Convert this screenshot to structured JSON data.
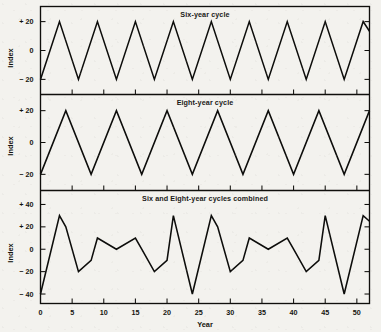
{
  "figure": {
    "xlabel": "Year",
    "ylabel": "Index",
    "background_color": "#f3f2ee",
    "line_color": "#0d0d0b"
  },
  "chart_data": {
    "type": "line",
    "title": "Six and Eight-year cycles combined",
    "xlabel": "Year",
    "ylabel": "Index",
    "xlim": [
      0,
      52
    ],
    "xticks": [
      0,
      5,
      10,
      15,
      20,
      25,
      30,
      35,
      40,
      45,
      50
    ],
    "xtick_labels": [
      "0",
      "5",
      "10",
      "15",
      "20",
      "25",
      "30",
      "35",
      "40",
      "45",
      "50"
    ],
    "grid": false,
    "legend": "none",
    "panels": [
      {
        "title": "Six-year cycle",
        "ylabel": "Index",
        "ylim": [
          -27,
          27
        ],
        "yticks": [
          20,
          0,
          -20
        ],
        "ytick_labels": [
          "+ 20",
          "0",
          "− 20"
        ],
        "period": 6,
        "amplitude": 20,
        "trough_year": 0,
        "peak_year": 3,
        "description": "Triangle wave, minimum -20 at year 0, maximum +20 at year 3, repeating every 6 years",
        "x": [
          0,
          3,
          6,
          9,
          12,
          15,
          18,
          21,
          24,
          27,
          30,
          33,
          36,
          39,
          42,
          45,
          48,
          51,
          52
        ],
        "y": [
          -20,
          20,
          -20,
          20,
          -20,
          20,
          -20,
          20,
          -20,
          20,
          -20,
          20,
          -20,
          20,
          -20,
          20,
          -20,
          20,
          13.3
        ]
      },
      {
        "title": "Eight-year cycle",
        "ylabel": "Index",
        "ylim": [
          -27,
          27
        ],
        "yticks": [
          20,
          0,
          -20
        ],
        "ytick_labels": [
          "+ 20",
          "0",
          "− 20"
        ],
        "period": 8,
        "amplitude": 20,
        "trough_year": 0,
        "peak_year": 4,
        "description": "Triangle wave, minimum -20 at year 0, maximum +20 at year 4, repeating every 8 years",
        "x": [
          0,
          4,
          8,
          12,
          16,
          20,
          24,
          28,
          32,
          36,
          40,
          44,
          48,
          52
        ],
        "y": [
          -20,
          20,
          -20,
          20,
          -20,
          20,
          -20,
          20,
          -20,
          20,
          -20,
          20,
          -20,
          20
        ]
      },
      {
        "title": "Six and Eight-year cycles combined",
        "ylabel": "Index",
        "ylim": [
          -44,
          48
        ],
        "yticks": [
          40,
          20,
          0,
          -20,
          -40
        ],
        "ytick_labels": [
          "+ 40",
          "+ 20",
          "0",
          "− 20",
          "− 40"
        ],
        "period": 24,
        "description": "Point-by-point sum of the six-year and eight-year triangle waves; repeats every 24 years, deep minimum of -40 at years 0, 24 and 48",
        "x": [
          0,
          3,
          4,
          6,
          8,
          9,
          12,
          15,
          16,
          18,
          20,
          21,
          24,
          27,
          28,
          30,
          32,
          33,
          36,
          39,
          40,
          42,
          44,
          45,
          48,
          51,
          52
        ],
        "y": [
          -40,
          30,
          20,
          -20,
          -10,
          10,
          0,
          10,
          0,
          -20,
          -10,
          30,
          -40,
          30,
          20,
          -20,
          -10,
          10,
          0,
          10,
          0,
          -20,
          -10,
          30,
          -40,
          30,
          25
        ]
      }
    ]
  }
}
